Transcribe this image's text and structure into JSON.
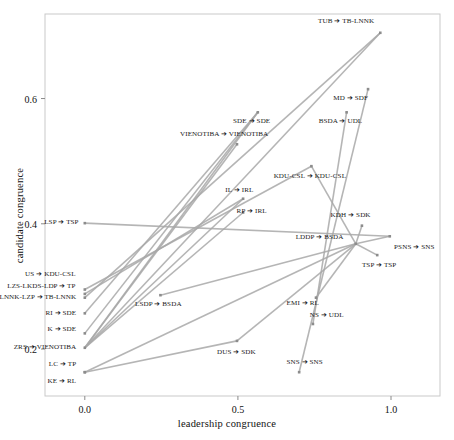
{
  "chart_data": {
    "type": "scatter",
    "title": "",
    "xlabel": "leadership congruence",
    "ylabel": "candidate congruence",
    "xlim": [
      -0.13,
      1.16
    ],
    "ylim": [
      0.125,
      0.735
    ],
    "xticks": [
      "0.0",
      "0.5",
      "1.0"
    ],
    "xtickvals": [
      0.0,
      0.5,
      1.0
    ],
    "yticks": [
      "0.2",
      "0.4",
      "0.6"
    ],
    "ytickvals": [
      0.2,
      0.4,
      0.6
    ],
    "grid": false,
    "legend": "none",
    "point_color": "#8c8c8c",
    "line_color": "#a8a8a8",
    "frame_color": "#c9c9c9",
    "pairs": [
      {
        "label": "TUB ➔ TB-LNNK",
        "x": 0.965,
        "y": 0.705,
        "anchor": "r",
        "lx": 0.945,
        "ly": 0.722
      },
      {
        "label": "MD ➔ SDF",
        "x": 0.925,
        "y": 0.615,
        "anchor": "r",
        "lx": 0.925,
        "ly": 0.6
      },
      {
        "label": "SDE ➔ SDE",
        "x": 0.565,
        "y": 0.578,
        "anchor": "c",
        "lx": 0.545,
        "ly": 0.562
      },
      {
        "label": "BSDA ➔ UDL",
        "x": 0.855,
        "y": 0.578,
        "anchor": "c",
        "lx": 0.835,
        "ly": 0.562
      },
      {
        "label": "VIENOTIBA ➔ VIENOTIBA",
        "x": 0.497,
        "y": 0.527,
        "anchor": "c",
        "lx": 0.455,
        "ly": 0.541
      },
      {
        "label": "KDU-CSL ➔ KDU-CSL",
        "x": 0.74,
        "y": 0.492,
        "anchor": "c",
        "lx": 0.735,
        "ly": 0.474
      },
      {
        "label": "IL ➔ IRL",
        "x": 0.517,
        "y": 0.44,
        "anchor": "c",
        "lx": 0.505,
        "ly": 0.452
      },
      {
        "label": "RP ➔ IRL",
        "x": 0.517,
        "y": 0.418,
        "anchor": "c",
        "lx": 0.545,
        "ly": 0.419
      },
      {
        "label": "KDH ➔ SDK",
        "x": 0.905,
        "y": 0.397,
        "anchor": "c",
        "lx": 0.868,
        "ly": 0.412
      },
      {
        "label": "LSP ➔ TSP",
        "x": 0.0,
        "y": 0.401,
        "anchor": "r",
        "lx": -0.02,
        "ly": 0.402
      },
      {
        "label": "LDDP ➔ BSDA",
        "x": 0.885,
        "y": 0.368,
        "anchor": "r",
        "lx": 0.845,
        "ly": 0.377
      },
      {
        "label": "PSNS ➔ SNS",
        "x": 0.996,
        "y": 0.38,
        "anchor": "l",
        "lx": 1.01,
        "ly": 0.362
      },
      {
        "label": "TSP ➔ TSP",
        "x": 0.955,
        "y": 0.35,
        "anchor": "l",
        "lx": 0.905,
        "ly": 0.332
      },
      {
        "label": "US ➔ KDU-CSL",
        "x": 0.0,
        "y": 0.295,
        "anchor": "r",
        "lx": -0.03,
        "ly": 0.318
      },
      {
        "label": "LZS-LKDS-LDP ➔ TP",
        "x": 0.0,
        "y": 0.288,
        "anchor": "r",
        "lx": -0.03,
        "ly": 0.299
      },
      {
        "label": "LNNK-LZP ➔ TB-LNNK",
        "x": 0.0,
        "y": 0.282,
        "anchor": "r",
        "lx": -0.028,
        "ly": 0.281
      },
      {
        "label": "LSDP ➔ BSDA",
        "x": 0.247,
        "y": 0.286,
        "anchor": "c",
        "lx": 0.24,
        "ly": 0.27
      },
      {
        "label": "EMI ➔ RL",
        "x": 0.755,
        "y": 0.282,
        "anchor": "c",
        "lx": 0.712,
        "ly": 0.272
      },
      {
        "label": "RI ➔ SDE",
        "x": 0.0,
        "y": 0.257,
        "anchor": "r",
        "lx": -0.028,
        "ly": 0.256
      },
      {
        "label": "NS ➔ UDL",
        "x": 0.745,
        "y": 0.24,
        "anchor": "c",
        "lx": 0.79,
        "ly": 0.252
      },
      {
        "label": "K ➔ SDE",
        "x": 0.0,
        "y": 0.225,
        "anchor": "r",
        "lx": -0.028,
        "ly": 0.231
      },
      {
        "label": "ZRS ➔ VIENOTIBA",
        "x": 0.0,
        "y": 0.202,
        "anchor": "r",
        "lx": -0.028,
        "ly": 0.202
      },
      {
        "label": "DUS ➔ SDK",
        "x": 0.497,
        "y": 0.213,
        "anchor": "c",
        "lx": 0.495,
        "ly": 0.193
      },
      {
        "label": "SNS ➔ SNS",
        "x": 0.7,
        "y": 0.163,
        "anchor": "c",
        "lx": 0.718,
        "ly": 0.178
      },
      {
        "label": "LC ➔ TP",
        "x": 0.0,
        "y": 0.163,
        "anchor": "r",
        "lx": -0.028,
        "ly": 0.174
      },
      {
        "label": "KE ➔ RL",
        "x": 0.0,
        "y": 0.163,
        "anchor": "r",
        "lx": -0.028,
        "ly": 0.148
      }
    ],
    "segments": [
      {
        "x1": 0.0,
        "y1": 0.202,
        "x2": 0.965,
        "y2": 0.705
      },
      {
        "x1": 0.0,
        "y1": 0.202,
        "x2": 0.565,
        "y2": 0.578
      },
      {
        "x1": 0.0,
        "y1": 0.202,
        "x2": 0.497,
        "y2": 0.527
      },
      {
        "x1": 0.0,
        "y1": 0.202,
        "x2": 0.517,
        "y2": 0.44
      },
      {
        "x1": 0.0,
        "y1": 0.202,
        "x2": 0.517,
        "y2": 0.418
      },
      {
        "x1": 0.0,
        "y1": 0.282,
        "x2": 0.965,
        "y2": 0.705
      },
      {
        "x1": 0.0,
        "y1": 0.288,
        "x2": 0.517,
        "y2": 0.44
      },
      {
        "x1": 0.0,
        "y1": 0.295,
        "x2": 0.74,
        "y2": 0.492
      },
      {
        "x1": 0.0,
        "y1": 0.257,
        "x2": 0.565,
        "y2": 0.578
      },
      {
        "x1": 0.0,
        "y1": 0.225,
        "x2": 0.565,
        "y2": 0.578
      },
      {
        "x1": 0.0,
        "y1": 0.163,
        "x2": 0.497,
        "y2": 0.213
      },
      {
        "x1": 0.0,
        "y1": 0.163,
        "x2": 0.885,
        "y2": 0.368
      },
      {
        "x1": 0.0,
        "y1": 0.401,
        "x2": 0.996,
        "y2": 0.38
      },
      {
        "x1": 0.247,
        "y1": 0.286,
        "x2": 0.885,
        "y2": 0.368
      },
      {
        "x1": 0.7,
        "y1": 0.163,
        "x2": 0.925,
        "y2": 0.615
      },
      {
        "x1": 0.745,
        "y1": 0.24,
        "x2": 0.855,
        "y2": 0.578
      },
      {
        "x1": 0.755,
        "y1": 0.282,
        "x2": 0.885,
        "y2": 0.368
      },
      {
        "x1": 0.905,
        "y1": 0.397,
        "x2": 0.885,
        "y2": 0.368
      },
      {
        "x1": 0.955,
        "y1": 0.35,
        "x2": 0.885,
        "y2": 0.368
      },
      {
        "x1": 0.996,
        "y1": 0.38,
        "x2": 0.885,
        "y2": 0.368
      },
      {
        "x1": 0.885,
        "y1": 0.368,
        "x2": 0.497,
        "y2": 0.213
      },
      {
        "x1": 0.885,
        "y1": 0.368,
        "x2": 0.74,
        "y2": 0.492
      }
    ]
  }
}
